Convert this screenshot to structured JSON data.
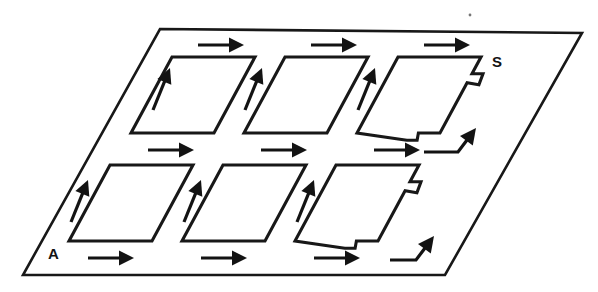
{
  "figure": {
    "kind": "technical-line-diagram",
    "background_color": "#ffffff",
    "ink_color": "#131313",
    "canvas": {
      "width": 598,
      "height": 292
    }
  },
  "plane": {
    "name": "outer-plane",
    "corners": [
      {
        "x": 160,
        "y": 29
      },
      {
        "x": 582,
        "y": 33
      },
      {
        "x": 445,
        "y": 275
      },
      {
        "x": 23,
        "y": 275
      }
    ]
  },
  "labels": [
    {
      "id": "label-s",
      "text": "S",
      "x": 492,
      "y": 67
    },
    {
      "id": "label-a",
      "text": "A",
      "x": 48,
      "y": 259
    }
  ],
  "geometry": {
    "cell_width": 83,
    "cell_height": 76,
    "skew_dx": -41,
    "notch_depth": 11,
    "notch_run": 9
  },
  "cells": [
    {
      "id": "cell-r1-c1",
      "row": 1,
      "column": 1,
      "shape": "parallelogram",
      "notched": false,
      "top_left": {
        "x": 172,
        "y": 57
      }
    },
    {
      "id": "cell-r1-c2",
      "row": 1,
      "column": 2,
      "shape": "parallelogram",
      "notched": false,
      "top_left": {
        "x": 285,
        "y": 57
      }
    },
    {
      "id": "cell-r1-c3",
      "row": 1,
      "column": 3,
      "shape": "notched-parallelogram",
      "notched": true,
      "top_left": {
        "x": 398,
        "y": 57
      }
    },
    {
      "id": "cell-r2-c1",
      "row": 2,
      "column": 1,
      "shape": "parallelogram",
      "notched": false,
      "top_left": {
        "x": 110,
        "y": 165
      }
    },
    {
      "id": "cell-r2-c2",
      "row": 2,
      "column": 2,
      "shape": "parallelogram",
      "notched": false,
      "top_left": {
        "x": 223,
        "y": 165
      }
    },
    {
      "id": "cell-r2-c3",
      "row": 2,
      "column": 3,
      "shape": "notched-parallelogram",
      "notched": true,
      "top_left": {
        "x": 336,
        "y": 165
      }
    }
  ],
  "arrows": {
    "horizontal": [
      {
        "id": "arrow-h-top-1",
        "direction": "right",
        "x": 198,
        "y": 45,
        "length": 46
      },
      {
        "id": "arrow-h-top-2",
        "direction": "right",
        "x": 311,
        "y": 45,
        "length": 46
      },
      {
        "id": "arrow-h-top-3",
        "direction": "right",
        "x": 424,
        "y": 45,
        "length": 46
      },
      {
        "id": "arrow-h-mid-1",
        "direction": "right",
        "x": 148,
        "y": 150,
        "length": 46
      },
      {
        "id": "arrow-h-mid-2",
        "direction": "right",
        "x": 261,
        "y": 150,
        "length": 46
      },
      {
        "id": "arrow-h-mid-3",
        "direction": "right",
        "x": 374,
        "y": 150,
        "length": 46
      },
      {
        "id": "arrow-h-bot-1",
        "direction": "right",
        "x": 88,
        "y": 258,
        "length": 46
      },
      {
        "id": "arrow-h-bot-2",
        "direction": "right",
        "x": 201,
        "y": 258,
        "length": 46
      },
      {
        "id": "arrow-h-bot-3",
        "direction": "right",
        "x": 314,
        "y": 258,
        "length": 46
      }
    ],
    "diagonal": [
      {
        "id": "arrow-d-top-1",
        "direction": "up-left",
        "tail_x": 153,
        "tail_y": 110,
        "tip_x": 170,
        "tip_y": 68
      },
      {
        "id": "arrow-d-top-2",
        "direction": "up-left",
        "tail_x": 245,
        "tail_y": 110,
        "tip_x": 262,
        "tip_y": 68
      },
      {
        "id": "arrow-d-top-3",
        "direction": "up-left",
        "tail_x": 358,
        "tail_y": 110,
        "tip_x": 375,
        "tip_y": 68
      },
      {
        "id": "arrow-d-bot-1",
        "direction": "up-left",
        "tail_x": 71,
        "tail_y": 222,
        "tip_x": 88,
        "tip_y": 180
      },
      {
        "id": "arrow-d-bot-2",
        "direction": "up-left",
        "tail_x": 184,
        "tail_y": 222,
        "tip_x": 201,
        "tip_y": 180
      },
      {
        "id": "arrow-d-bot-3",
        "direction": "up-left",
        "tail_x": 297,
        "tail_y": 222,
        "tip_x": 314,
        "tip_y": 180
      }
    ],
    "bent": [
      {
        "id": "arrow-bent-top",
        "direction": "right-then-up-right",
        "start_x": 424,
        "start_y": 152,
        "corner_x": 458,
        "corner_y": 152,
        "tip_x": 476,
        "tip_y": 128
      },
      {
        "id": "arrow-bent-bottom",
        "direction": "right-then-up-right",
        "start_x": 390,
        "start_y": 260,
        "corner_x": 416,
        "corner_y": 260,
        "tip_x": 434,
        "tip_y": 236
      }
    ]
  },
  "specks": [
    {
      "id": "speck-1",
      "x": 470,
      "y": 15,
      "r": 1.4
    }
  ]
}
